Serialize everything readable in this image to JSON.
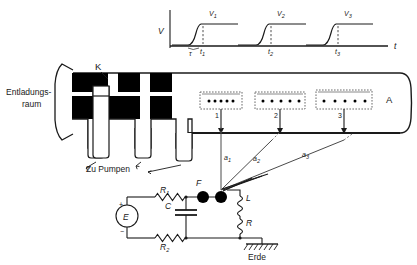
{
  "diagram": {
    "colors": {
      "line": "#1a1a1a",
      "fill_electrode": "#000000",
      "background": "#ffffff",
      "dashed": "#555555"
    }
  },
  "waveform": {
    "axis_y_label": "V",
    "axis_x_label": "t",
    "pulses": [
      {
        "amplitude_label": "V",
        "amplitude_sub": "1",
        "time_label": "t",
        "time_sub": "1"
      },
      {
        "amplitude_label": "V",
        "amplitude_sub": "2",
        "time_label": "t",
        "time_sub": "2"
      },
      {
        "amplitude_label": "V",
        "amplitude_sub": "3",
        "time_label": "t",
        "time_sub": "3"
      }
    ],
    "rise_time_label": "τ"
  },
  "chamber": {
    "discharge_label_line1": "Entladungs-",
    "discharge_label_line2": "raum",
    "cathode_label": "K",
    "pumps_label": "Zu Pumpen",
    "anode_label": "A"
  },
  "stages": [
    {
      "number": "1",
      "dots": 5,
      "spacing": "tight"
    },
    {
      "number": "2",
      "dots": 5,
      "spacing": "medium"
    },
    {
      "number": "3",
      "dots": 5,
      "spacing": "wide"
    }
  ],
  "trajectories": [
    {
      "label": "a",
      "sub": "1"
    },
    {
      "label": "a",
      "sub": "2"
    },
    {
      "label": "a",
      "sub": "3"
    }
  ],
  "circuit": {
    "source_label": "E",
    "polarity_plus": "+",
    "polarity_minus": "−",
    "r1_label": "R",
    "r1_sub": "1",
    "r2_label": "R",
    "r2_sub": "2",
    "capacitor_label": "C",
    "spark_gap_label": "F",
    "inductor_label": "L",
    "resistor_label": "R",
    "ground_label": "Erde"
  }
}
